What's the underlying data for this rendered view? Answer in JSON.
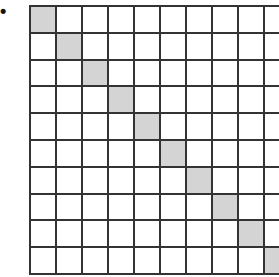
{
  "figure": {
    "label": "•",
    "grid": {
      "rows": 10,
      "cols": 10,
      "shaded_cells": [
        [
          0,
          0
        ],
        [
          1,
          1
        ],
        [
          2,
          2
        ],
        [
          3,
          3
        ],
        [
          4,
          4
        ],
        [
          5,
          5
        ],
        [
          6,
          6
        ],
        [
          7,
          7
        ],
        [
          8,
          8
        ],
        [
          9,
          9
        ]
      ],
      "shade_color": "#d4d4d4",
      "line_color": "#333333"
    }
  }
}
